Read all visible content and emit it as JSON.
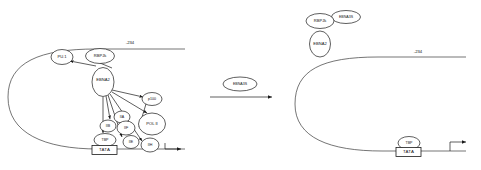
{
  "figure": {
    "panels": [
      "left",
      "right"
    ]
  },
  "left_panel": {
    "position_label": "-234",
    "tata_label": "TATA",
    "nodes": [
      {
        "id": "pu1",
        "label": "PU.1",
        "cx": 62,
        "cy": 57,
        "rx": 11,
        "ry": 7.5
      },
      {
        "id": "rbpjk",
        "label": "RBPJk",
        "cx": 100,
        "cy": 56,
        "rx": 14.5,
        "ry": 7.5
      },
      {
        "id": "ebna2",
        "label": "EBNA2",
        "cx": 103,
        "cy": 82,
        "rx": 11,
        "ry": 14.5
      },
      {
        "id": "p100",
        "label": "p100",
        "cx": 152,
        "cy": 99,
        "rx": 10,
        "ry": 6.5
      },
      {
        "id": "iia",
        "label": "IIA",
        "cx": 122,
        "cy": 117,
        "rx": 8,
        "ry": 6
      },
      {
        "id": "iib",
        "label": "IIB",
        "cx": 108,
        "cy": 126,
        "rx": 8,
        "ry": 6
      },
      {
        "id": "iif",
        "label": "IIF",
        "cx": 126,
        "cy": 128,
        "rx": 9,
        "ry": 7
      },
      {
        "id": "polii",
        "label": "POL II",
        "cx": 152,
        "cy": 124,
        "rx": 13.5,
        "ry": 11
      },
      {
        "id": "tbp",
        "label": "TBP",
        "cx": 105,
        "cy": 140,
        "rx": 11,
        "ry": 6.5
      },
      {
        "id": "iie",
        "label": "IIE",
        "cx": 131,
        "cy": 142,
        "rx": 8,
        "ry": 6.5
      },
      {
        "id": "iih",
        "label": "IIH",
        "cx": 150,
        "cy": 145,
        "rx": 9,
        "ry": 7
      }
    ]
  },
  "middle_arrow": {
    "label": "EBNA3S"
  },
  "right_panel": {
    "position_label": "-234",
    "tata_label": "TATA",
    "nodes": [
      {
        "id": "rbpjk",
        "label": "RBPJk",
        "cx": 320,
        "cy": 21,
        "rx": 14,
        "ry": 7.5
      },
      {
        "id": "ebna3s",
        "label": "EBNA3S",
        "cx": 346,
        "cy": 17,
        "rx": 14.5,
        "ry": 6.5
      },
      {
        "id": "ebna2",
        "label": "EBNA2",
        "cx": 320,
        "cy": 44,
        "rx": 10.5,
        "ry": 13
      },
      {
        "id": "tbp",
        "label": "TBP",
        "cx": 409,
        "cy": 143,
        "rx": 11,
        "ry": 6.5
      }
    ]
  },
  "colors": {
    "ink": "#1a1a1a",
    "dna": "#3a3a3a",
    "background": "#ffffff"
  }
}
